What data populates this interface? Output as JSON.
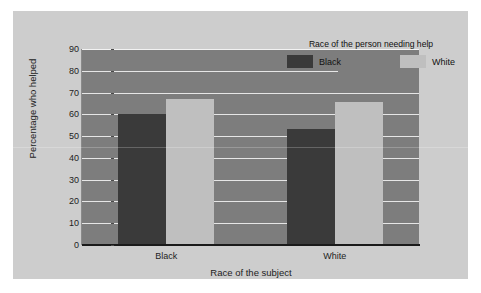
{
  "figure": {
    "background_color": "#cdcdcd",
    "plot_background_color": "#7d7d7d",
    "gridline_color": "#e6e6e6",
    "axis_color": "#1a1a1a"
  },
  "legend": {
    "title": "Race of the person needing help",
    "position": "top-right",
    "entries": [
      {
        "label": "Black",
        "color": "#3a3a3a"
      },
      {
        "label": "White",
        "color": "#bfbfbf"
      }
    ]
  },
  "axes": {
    "y_ticks": [
      "90",
      "80",
      "70",
      "60",
      "50",
      "40",
      "30",
      "20",
      "10",
      "0"
    ]
  },
  "chart_data": {
    "type": "bar",
    "title": "",
    "xlabel": "Race of the subject",
    "ylabel": "Percentage who helped",
    "categories": [
      "Black",
      "White"
    ],
    "series": [
      {
        "name": "Black",
        "color": "#3a3a3a",
        "values": [
          60,
          53.5
        ]
      },
      {
        "name": "White",
        "color": "#bfbfbf",
        "values": [
          67,
          65.5
        ]
      }
    ],
    "ylim": [
      0,
      90
    ],
    "ytick_step": 10,
    "grid": true,
    "legend_position": "top-right",
    "legend_title": "Race of the person needing help"
  }
}
